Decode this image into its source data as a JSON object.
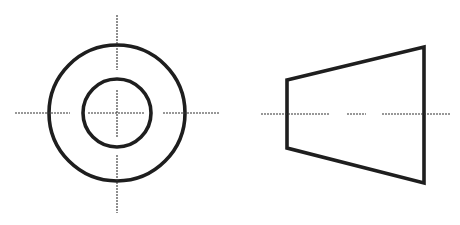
{
  "drawing": {
    "type": "orthographic projection of truncated cone (frustum) with bore",
    "colors": {
      "outline": "#1e1e1e",
      "centerline": "#333333",
      "background": "#ffffff"
    },
    "front_view": {
      "center": [
        117,
        113
      ],
      "outer_circle_radius": 68,
      "inner_circle_radius": 34,
      "horizontal_centerline_segments": [
        [
          15,
          70
        ],
        [
          88,
          145
        ],
        [
          163,
          220
        ]
      ],
      "vertical_centerline_segments": [
        [
          15,
          70
        ],
        [
          90,
          138
        ],
        [
          155,
          213
        ]
      ]
    },
    "side_view": {
      "vertices": [
        [
          287,
          80
        ],
        [
          424,
          47
        ],
        [
          424,
          183
        ],
        [
          287,
          148
        ]
      ],
      "centerline_y": 114,
      "centerline_segments": [
        [
          261,
          329
        ],
        [
          347,
          366
        ],
        [
          382,
          450
        ]
      ]
    }
  }
}
